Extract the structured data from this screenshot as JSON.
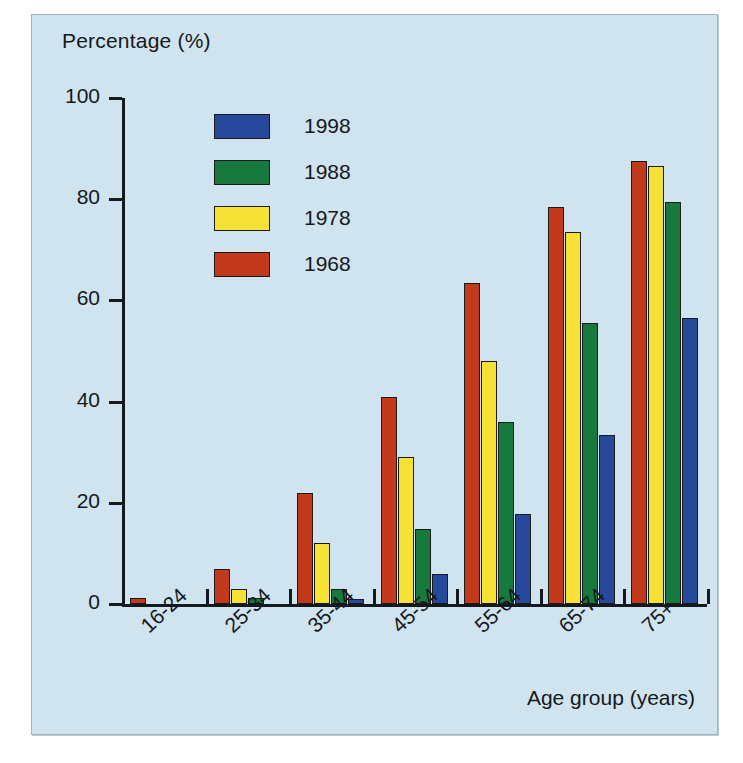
{
  "chart_data": {
    "type": "bar",
    "title": "",
    "ylabel": "Percentage (%)",
    "xlabel": "Age group (years)",
    "ylim": [
      0,
      100
    ],
    "yticks": [
      0,
      20,
      40,
      60,
      80,
      100
    ],
    "grid": false,
    "legend_position": "upper-left-inside",
    "categories": [
      "16-24",
      "25-34",
      "35-44",
      "45-54",
      "55-64",
      "65-74",
      "75+"
    ],
    "series": [
      {
        "name": "1968",
        "color": "#c2391b",
        "values": [
          1.2,
          7.0,
          22.0,
          41.0,
          63.5,
          78.5,
          87.5
        ]
      },
      {
        "name": "1978",
        "color": "#f5e235",
        "values": [
          0,
          3.0,
          12.0,
          29.0,
          48.0,
          73.5,
          86.5
        ]
      },
      {
        "name": "1988",
        "color": "#17793d",
        "values": [
          0,
          1.2,
          3.0,
          14.8,
          36.0,
          55.5,
          79.5
        ]
      },
      {
        "name": "1998",
        "color": "#27499b",
        "values": [
          0,
          0,
          1.0,
          6.0,
          17.8,
          33.5,
          56.5
        ]
      }
    ]
  },
  "legend": {
    "items": [
      {
        "label": "1998",
        "color": "#27499b"
      },
      {
        "label": "1988",
        "color": "#17793d"
      },
      {
        "label": "1978",
        "color": "#f5e235"
      },
      {
        "label": "1968",
        "color": "#c2391b"
      }
    ]
  },
  "colors": {
    "panel_background": "#cfe4ef",
    "axis": "#15181c",
    "series_1998": "#27499b",
    "series_1988": "#17793d",
    "series_1978": "#f5e235",
    "series_1968": "#c2391b"
  }
}
